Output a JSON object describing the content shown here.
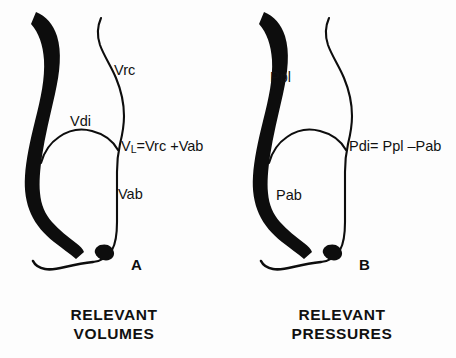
{
  "figure": {
    "background_color": "#fdfdfd",
    "ink_color": "#0d0d0d"
  },
  "panels": [
    {
      "id": "panel-a",
      "letter": "A",
      "caption_line1": "RELEVANT",
      "caption_line2": "VOLUMES",
      "labels": {
        "upper_compartment": "Vrc",
        "diaphragm": "Vdi",
        "lower_compartment": "Vab",
        "formula_lhs": "V",
        "formula_lhs_sub": "L",
        "formula_rhs": "=Vrc +Vab"
      }
    },
    {
      "id": "panel-b",
      "letter": "B",
      "caption_line1": "RELEVANT",
      "caption_line2": "PRESSURES",
      "labels": {
        "upper_compartment": "Ppl",
        "diaphragm": "",
        "lower_compartment": "Pab",
        "formula_lhs": "Pdi",
        "formula_lhs_sub": "",
        "formula_rhs": "= Ppl –Pab"
      }
    }
  ]
}
